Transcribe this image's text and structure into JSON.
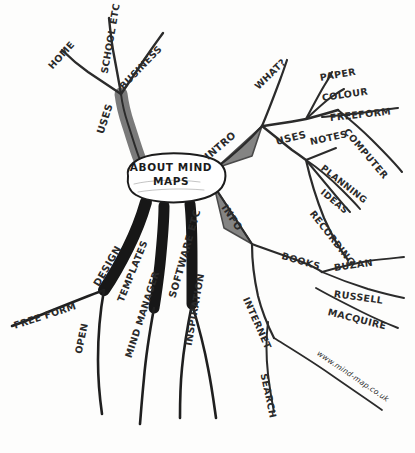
{
  "canvas": {
    "width": 415,
    "height": 453,
    "background": "#fdfdfc",
    "ink_color": "#2a2a2a"
  },
  "center": {
    "title_line_1": "ABOUT MIND",
    "title_line_2": "MAPS",
    "title_full": "ABOUT MIND MAPS"
  },
  "branches": {
    "uses_upper": {
      "label": "USES",
      "children": [
        {
          "label": "HOME"
        },
        {
          "label": "SCHOOL ETC"
        },
        {
          "label": "BUSINESS"
        }
      ]
    },
    "intro": {
      "label": "INTRO",
      "children": [
        {
          "label": "WHAT?"
        }
      ]
    },
    "uses_right": {
      "label": "USES",
      "children": [
        {
          "label": "PAPER"
        },
        {
          "label": "COLOUR"
        },
        {
          "label": "FREEFORM"
        },
        {
          "label": "COMPUTER"
        },
        {
          "label": "NOTES"
        },
        {
          "label": "PLANNING"
        },
        {
          "label": "IDEAS"
        },
        {
          "label": "RECORDING"
        }
      ]
    },
    "info": {
      "label": "INFO",
      "children": [
        {
          "label": "BOOKS",
          "children": [
            {
              "label": "BUZAN"
            },
            {
              "label": "RUSSELL"
            },
            {
              "label": "MACQUIRE"
            }
          ]
        },
        {
          "label": "INTERNET",
          "children": [
            {
              "label": "SEARCH"
            },
            {
              "label": "www.mind-map.co.uk"
            }
          ]
        }
      ]
    },
    "design": {
      "label": "DESIGN",
      "children": [
        {
          "label": "FREE FORM"
        },
        {
          "label": "TEMPLATES"
        },
        {
          "label": "OPEN"
        }
      ]
    },
    "software": {
      "label": "SOFTWARE ETC",
      "children": [
        {
          "label": "MIND MANAGER"
        },
        {
          "label": "INSPIRATION"
        }
      ]
    }
  }
}
